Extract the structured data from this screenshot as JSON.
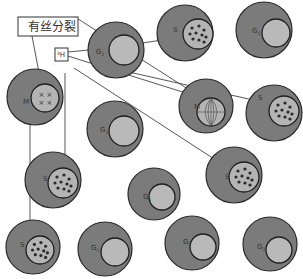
{
  "labels": {
    "mitosis": "有丝分裂",
    "tritium": "³H"
  },
  "cells": [
    {
      "id": "c1",
      "phase": "G2",
      "label": "G",
      "sub": "2",
      "nucleus": "plain"
    },
    {
      "id": "c2",
      "phase": "S",
      "label": "S",
      "sub": "",
      "nucleus": "dots"
    },
    {
      "id": "c3",
      "phase": "G1",
      "label": "G",
      "sub": "1",
      "nucleus": "plain"
    },
    {
      "id": "c4",
      "phase": "M",
      "label": "M",
      "sub": "",
      "nucleus": "chromosomes-x"
    },
    {
      "id": "c5",
      "phase": "G1",
      "label": "G",
      "sub": "1",
      "nucleus": "plain"
    },
    {
      "id": "c6",
      "phase": "M",
      "label": "M",
      "sub": "",
      "nucleus": "spindle"
    },
    {
      "id": "c7",
      "phase": "S",
      "label": "S",
      "sub": "",
      "nucleus": "dots"
    },
    {
      "id": "c8",
      "phase": "S",
      "label": "S",
      "sub": "",
      "nucleus": "dots"
    },
    {
      "id": "c9",
      "phase": "G1",
      "label": "G",
      "sub": "1",
      "nucleus": "plain"
    },
    {
      "id": "c10",
      "phase": "S",
      "label": "S",
      "sub": "",
      "nucleus": "dots"
    },
    {
      "id": "c11",
      "phase": "S",
      "label": "S",
      "sub": "",
      "nucleus": "dots"
    },
    {
      "id": "c12",
      "phase": "G1",
      "label": "G",
      "sub": "1",
      "nucleus": "plain"
    },
    {
      "id": "c13",
      "phase": "G1",
      "label": "G",
      "sub": "1",
      "nucleus": "plain"
    },
    {
      "id": "c14",
      "phase": "G2",
      "label": "G",
      "sub": "2",
      "nucleus": "plain"
    }
  ]
}
